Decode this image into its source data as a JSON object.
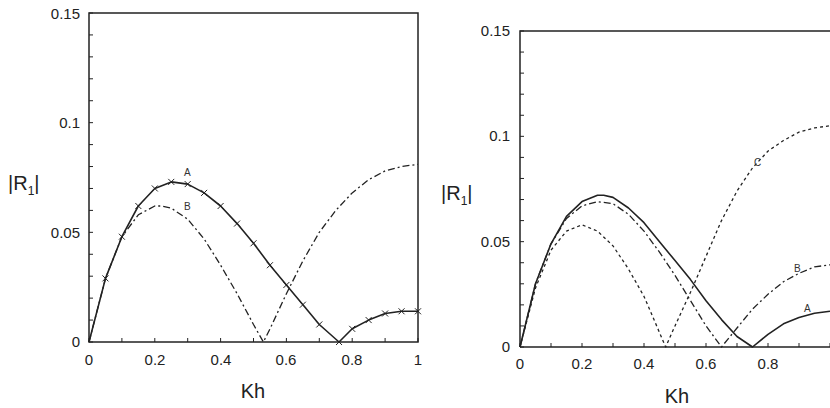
{
  "chart_data": [
    {
      "type": "line",
      "panel": "left",
      "title": "",
      "xlabel": "Kh",
      "ylabel": "|R1|",
      "xlim": [
        0,
        1
      ],
      "ylim": [
        0,
        0.15
      ],
      "xticks": [
        "0",
        "0.2",
        "0.4",
        "0.6",
        "0.8",
        "1"
      ],
      "yticks": [
        "0",
        "0.05",
        "0.1",
        "0.15"
      ],
      "grid": false,
      "series": [
        {
          "name": "A",
          "style": "solid-with-x-markers",
          "x": [
            0,
            0.05,
            0.1,
            0.15,
            0.2,
            0.25,
            0.3,
            0.35,
            0.4,
            0.45,
            0.5,
            0.55,
            0.6,
            0.65,
            0.7,
            0.76,
            0.8,
            0.85,
            0.9,
            0.95,
            1.0
          ],
          "y": [
            0,
            0.029,
            0.048,
            0.062,
            0.07,
            0.073,
            0.072,
            0.068,
            0.062,
            0.054,
            0.045,
            0.035,
            0.026,
            0.017,
            0.008,
            0,
            0.006,
            0.01,
            0.013,
            0.014,
            0.014
          ]
        },
        {
          "name": "B",
          "style": "dash-dot",
          "x": [
            0,
            0.05,
            0.1,
            0.15,
            0.2,
            0.22,
            0.25,
            0.3,
            0.35,
            0.4,
            0.45,
            0.5,
            0.53,
            0.55,
            0.6,
            0.65,
            0.7,
            0.75,
            0.8,
            0.85,
            0.9,
            0.95,
            1.0
          ],
          "y": [
            0,
            0.029,
            0.048,
            0.058,
            0.062,
            0.062,
            0.061,
            0.056,
            0.047,
            0.035,
            0.022,
            0.008,
            0,
            0.006,
            0.022,
            0.037,
            0.05,
            0.06,
            0.068,
            0.074,
            0.078,
            0.08,
            0.081
          ]
        }
      ],
      "annotations": [
        {
          "text": "A",
          "x": 0.3,
          "y": 0.0775
        },
        {
          "text": "B",
          "x": 0.3,
          "y": 0.0625
        }
      ]
    },
    {
      "type": "line",
      "panel": "right",
      "title": "",
      "xlabel": "Kh",
      "ylabel": "|R1|",
      "xlim": [
        0,
        1
      ],
      "ylim": [
        0,
        0.15
      ],
      "xticks": [
        "0",
        "0.2",
        "0.4",
        "0.6",
        "0.8"
      ],
      "yticks": [
        "0",
        "0.05",
        "0.1",
        "0.15"
      ],
      "grid": false,
      "series": [
        {
          "name": "A",
          "style": "solid",
          "x": [
            0,
            0.05,
            0.1,
            0.15,
            0.2,
            0.25,
            0.27,
            0.3,
            0.35,
            0.4,
            0.45,
            0.5,
            0.55,
            0.6,
            0.65,
            0.7,
            0.75,
            0.8,
            0.85,
            0.9,
            0.95,
            1.0
          ],
          "y": [
            0,
            0.03,
            0.049,
            0.062,
            0.069,
            0.072,
            0.072,
            0.071,
            0.066,
            0.059,
            0.05,
            0.041,
            0.032,
            0.022,
            0.013,
            0.005,
            0,
            0.006,
            0.011,
            0.014,
            0.016,
            0.017
          ]
        },
        {
          "name": "B",
          "style": "dash-dot",
          "x": [
            0,
            0.05,
            0.1,
            0.15,
            0.2,
            0.25,
            0.3,
            0.35,
            0.4,
            0.45,
            0.5,
            0.55,
            0.6,
            0.65,
            0.7,
            0.75,
            0.8,
            0.85,
            0.9,
            0.95,
            1.0
          ],
          "y": [
            0,
            0.03,
            0.049,
            0.061,
            0.067,
            0.069,
            0.068,
            0.063,
            0.055,
            0.045,
            0.034,
            0.022,
            0.01,
            0,
            0.009,
            0.018,
            0.025,
            0.031,
            0.035,
            0.038,
            0.039
          ]
        },
        {
          "name": "C",
          "style": "dotted",
          "x": [
            0,
            0.05,
            0.1,
            0.15,
            0.2,
            0.25,
            0.3,
            0.35,
            0.4,
            0.47,
            0.5,
            0.55,
            0.6,
            0.65,
            0.7,
            0.75,
            0.8,
            0.85,
            0.9,
            0.95,
            1.0
          ],
          "y": [
            0,
            0.028,
            0.046,
            0.055,
            0.058,
            0.055,
            0.048,
            0.037,
            0.024,
            0,
            0.01,
            0.026,
            0.043,
            0.06,
            0.074,
            0.085,
            0.093,
            0.098,
            0.102,
            0.104,
            0.105
          ]
        }
      ],
      "annotations": [
        {
          "text": "C",
          "x": 0.6,
          "y": 0.087
        },
        {
          "text": "B",
          "x": 0.77,
          "y": 0.04
        },
        {
          "text": "A",
          "x": 0.77,
          "y": 0.019
        }
      ]
    }
  ],
  "left": {
    "ylabel_main": "|R",
    "ylabel_sub": "1",
    "ylabel_end": "|",
    "xlabel": "Kh",
    "xticks": [
      "0",
      "0.2",
      "0.4",
      "0.6",
      "0.8",
      "1"
    ],
    "yticks": [
      "0",
      "0.05",
      "0.1",
      "0.15"
    ],
    "labels": {
      "A": "A",
      "B": "B"
    }
  },
  "right": {
    "ylabel_main": "|R",
    "ylabel_sub": "1",
    "ylabel_end": "|",
    "xlabel": "Kh",
    "xticks": [
      "0",
      "0.2",
      "0.4",
      "0.6",
      "0.8"
    ],
    "yticks": [
      "0",
      "0.05",
      "0.1",
      "0.15"
    ],
    "labels": {
      "A": "A",
      "B": "B",
      "C": "C"
    }
  }
}
